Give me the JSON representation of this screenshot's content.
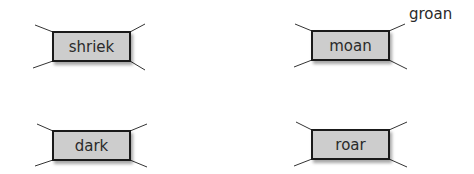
{
  "boxes": [
    {
      "word": "shriek",
      "x": 52,
      "y": 31,
      "w": 79,
      "h": 31
    },
    {
      "word": "moan",
      "x": 311,
      "y": 30,
      "w": 79,
      "h": 31
    },
    {
      "word": "dark",
      "x": 52,
      "y": 130,
      "w": 79,
      "h": 31
    },
    {
      "word": "roar",
      "x": 311,
      "y": 129,
      "w": 79,
      "h": 31
    }
  ],
  "answers": {
    "moan_synonym": "groan"
  },
  "colors": {
    "box_fill": "#cdcdcd",
    "box_border": "#1a1a1a",
    "line": "#333333"
  }
}
